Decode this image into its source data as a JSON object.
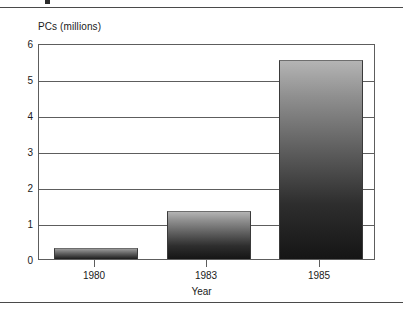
{
  "figure": {
    "y_axis_title": "PCs (millions)",
    "x_axis_title": "Year"
  },
  "axis": {
    "y_ticks": [
      "0",
      "1",
      "2",
      "3",
      "4",
      "5",
      "6"
    ],
    "x_ticks": [
      "1980",
      "1983",
      "1985"
    ]
  },
  "colors": {
    "rule": "#4a4a4a",
    "axis": "#5d5d5d",
    "bar_top": "#b4b4b4",
    "bar_bottom": "#151515",
    "text": "#1a1a1a",
    "background": "#ffffff"
  },
  "chart_data": {
    "type": "bar",
    "title": "",
    "subtitle": "",
    "categories": [
      "1980",
      "1983",
      "1985"
    ],
    "values": [
      0.28,
      1.3,
      5.5
    ],
    "series": [
      {
        "name": "PCs (millions)",
        "values": [
          0.28,
          1.3,
          5.5
        ]
      }
    ],
    "xlabel": "Year",
    "ylabel": "PCs (millions)",
    "ylim": [
      0,
      6
    ],
    "ytick_values": [
      0,
      1,
      2,
      3,
      4,
      5,
      6
    ],
    "grid": true,
    "grid_axis": "y",
    "legend": false,
    "legend_position": "none",
    "bar_fill": "vertical-gradient-light-to-dark",
    "annotations": []
  }
}
